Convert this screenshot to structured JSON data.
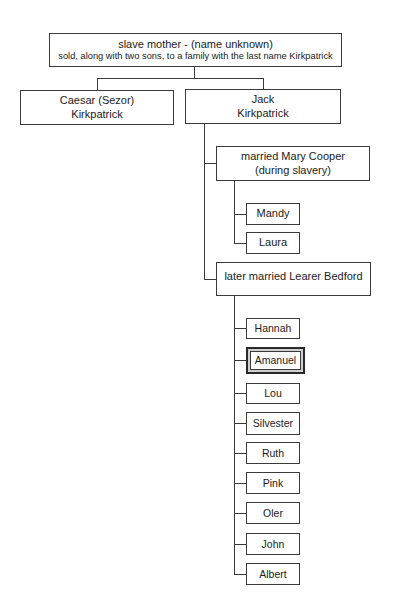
{
  "root": {
    "line1": "slave mother - (name unknown)",
    "line2": "sold, along with two sons, to a family with the last name Kirkpatrick"
  },
  "sons": [
    {
      "line1": "Caesar (Sezor)",
      "line2": "Kirkpatrick"
    },
    {
      "line1": "Jack",
      "line2": "Kirkpatrick"
    }
  ],
  "marriages": [
    {
      "line1": "married Mary Cooper",
      "line2": "(during slavery)",
      "children": [
        "Mandy",
        "Laura"
      ]
    },
    {
      "line1": "later married Learer Bedford",
      "children": [
        "Hannah",
        "Amanuel",
        "Lou",
        "Silvester",
        "Ruth",
        "Pink",
        "Oler",
        "John",
        "Albert"
      ],
      "highlighted_child": "Amanuel"
    }
  ]
}
